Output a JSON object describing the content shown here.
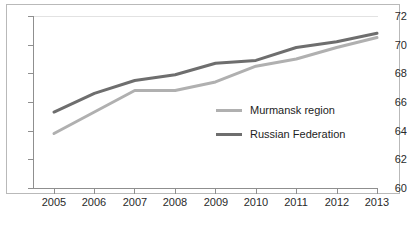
{
  "chart_data": {
    "type": "line",
    "title": "",
    "subtitle": "",
    "xlabel": "",
    "ylabel": "",
    "x": [
      2005,
      2006,
      2007,
      2008,
      2009,
      2010,
      2011,
      2012,
      2013
    ],
    "categories": [
      "2005",
      "2006",
      "2007",
      "2008",
      "2009",
      "2010",
      "2011",
      "2012",
      "2013"
    ],
    "series": [
      {
        "name": "Murmansk region",
        "color": "#b0b0b0",
        "values": [
          63.8,
          65.3,
          66.8,
          66.8,
          67.4,
          68.5,
          69.0,
          69.8,
          70.5
        ]
      },
      {
        "name": "Russian Federation",
        "color": "#6e6e6e",
        "values": [
          65.3,
          66.6,
          67.5,
          67.9,
          68.7,
          68.9,
          69.8,
          70.2,
          70.8
        ]
      }
    ],
    "ylim": [
      60,
      72
    ],
    "yticks": [
      60,
      62,
      64,
      66,
      68,
      70,
      72
    ],
    "ytick_labels": [
      "60",
      "62",
      "64",
      "66",
      "68",
      "70",
      "72"
    ],
    "xlim": [
      2005,
      2013
    ],
    "grid": false,
    "legend_position": "inside-right"
  },
  "legend": {
    "entries": [
      {
        "label": "Murmansk region",
        "color": "#b0b0b0"
      },
      {
        "label": "Russian Federation",
        "color": "#6e6e6e"
      }
    ]
  },
  "axes": {
    "y_labels": [
      "72",
      "70",
      "68",
      "66",
      "64",
      "62",
      "60"
    ],
    "x_labels": [
      "2005",
      "2006",
      "2007",
      "2008",
      "2009",
      "2010",
      "2011",
      "2012",
      "2013"
    ]
  }
}
